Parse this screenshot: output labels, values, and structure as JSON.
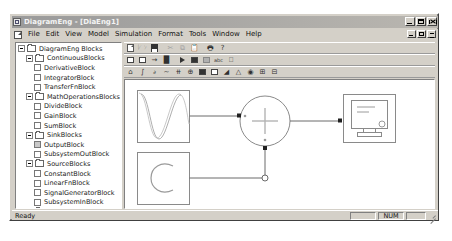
{
  "window": {
    "title": "DiagramEng - [DiaEng1]",
    "app_icon": "diagram-app-icon",
    "controls": [
      {
        "name": "minimize",
        "glyph": "_"
      },
      {
        "name": "maximize",
        "glyph": "□"
      },
      {
        "name": "close",
        "glyph": "✕"
      }
    ],
    "mdi_controls": [
      {
        "name": "mdi-minimize",
        "glyph": "_"
      },
      {
        "name": "mdi-restore",
        "glyph": "❐"
      },
      {
        "name": "mdi-close",
        "glyph": "✕"
      }
    ]
  },
  "menubar": {
    "doc_icon": "document-icon",
    "items": [
      {
        "label": "File"
      },
      {
        "label": "Edit"
      },
      {
        "label": "View"
      },
      {
        "label": "Model"
      },
      {
        "label": "Simulation"
      },
      {
        "label": "Format"
      },
      {
        "label": "Tools"
      },
      {
        "label": "Window"
      },
      {
        "label": "Help"
      }
    ]
  },
  "toolbars": [
    {
      "name": "standard-toolbar",
      "buttons": [
        {
          "name": "new-file",
          "icon": "doc"
        },
        {
          "name": "open-file",
          "icon": "folder-open"
        },
        {
          "name": "save-file",
          "icon": "floppy"
        },
        {
          "sep": true
        },
        {
          "name": "cut",
          "icon": "scissors",
          "disabled": true
        },
        {
          "name": "copy",
          "icon": "copy",
          "disabled": true
        },
        {
          "name": "paste",
          "icon": "clipboard",
          "disabled": true
        },
        {
          "sep": true
        },
        {
          "name": "print",
          "icon": "printer"
        },
        {
          "name": "about",
          "icon": "question"
        }
      ]
    },
    {
      "name": "model-toolbar",
      "buttons": [
        {
          "name": "new-block",
          "icon": "square"
        },
        {
          "name": "block-group",
          "icon": "square-wide"
        },
        {
          "name": "connection",
          "icon": "arrow-bend"
        },
        {
          "name": "paint",
          "icon": "paint"
        },
        {
          "sep": true
        },
        {
          "name": "run-simulation",
          "icon": "play"
        },
        {
          "name": "stop-simulation",
          "icon": "stop"
        },
        {
          "name": "simulation-params",
          "icon": "panel"
        },
        {
          "name": "label-abc",
          "icon": "abc"
        },
        {
          "name": "zoom-fit",
          "icon": "fit"
        }
      ]
    },
    {
      "name": "blocks-toolbar",
      "buttons": [
        {
          "name": "output-block-tool",
          "icon": "home"
        },
        {
          "name": "integrator-block-tool",
          "icon": "integral"
        },
        {
          "name": "derivative-block-tool",
          "icon": "derivative"
        },
        {
          "name": "transfer-fn-block-tool",
          "icon": "transfer"
        },
        {
          "name": "divide-block-tool",
          "icon": "divide"
        },
        {
          "name": "sum-block-tool",
          "icon": "sum-circle"
        },
        {
          "name": "display-block-tool",
          "icon": "monitor"
        },
        {
          "name": "constant-block-tool",
          "icon": "constant"
        },
        {
          "name": "signal-generator-tool",
          "icon": "ramp"
        },
        {
          "name": "gain-block-tool",
          "icon": "triangle-gain"
        },
        {
          "name": "subsystem-block-tool",
          "icon": "subsystem"
        },
        {
          "name": "subsystem-in-tool",
          "icon": "subsystem-in"
        },
        {
          "name": "subsystem-out-tool",
          "icon": "subsystem-out"
        }
      ]
    }
  ],
  "tree": {
    "name": "block-library-tree",
    "nodes": [
      {
        "label": "DiagramEng Blocks",
        "depth": 0,
        "type": "folder",
        "expanded": true
      },
      {
        "label": "ContinuousBlocks",
        "depth": 1,
        "type": "folder",
        "expanded": true
      },
      {
        "label": "DerivativeBlock",
        "depth": 2,
        "type": "leaf"
      },
      {
        "label": "IntegratorBlock",
        "depth": 2,
        "type": "leaf"
      },
      {
        "label": "TransferFnBlock",
        "depth": 2,
        "type": "leaf"
      },
      {
        "label": "MathOperationsBlocks",
        "depth": 1,
        "type": "folder",
        "expanded": true
      },
      {
        "label": "DivideBlock",
        "depth": 2,
        "type": "leaf"
      },
      {
        "label": "GainBlock",
        "depth": 2,
        "type": "leaf"
      },
      {
        "label": "SumBlock",
        "depth": 2,
        "type": "leaf"
      },
      {
        "label": "SinkBlocks",
        "depth": 1,
        "type": "folder",
        "expanded": true
      },
      {
        "label": "OutputBlock",
        "depth": 2,
        "type": "leaf",
        "selected": true
      },
      {
        "label": "SubsystemOutBlock",
        "depth": 2,
        "type": "leaf"
      },
      {
        "label": "SourceBlocks",
        "depth": 1,
        "type": "folder",
        "expanded": true
      },
      {
        "label": "ConstantBlock",
        "depth": 2,
        "type": "leaf"
      },
      {
        "label": "LinearFnBlock",
        "depth": 2,
        "type": "leaf"
      },
      {
        "label": "SignalGeneratorBlock",
        "depth": 2,
        "type": "leaf"
      },
      {
        "label": "SubsystemInBlock",
        "depth": 2,
        "type": "leaf"
      },
      {
        "label": "SubsystemBlocks",
        "depth": 1,
        "type": "folder",
        "expanded": true
      },
      {
        "label": "SubsystemBlock",
        "depth": 2,
        "type": "leaf"
      },
      {
        "label": "SubsystemInBlock",
        "depth": 2,
        "type": "leaf"
      },
      {
        "label": "SubsystemOutBlock",
        "depth": 2,
        "type": "leaf"
      }
    ]
  },
  "canvas": {
    "name": "diagram-canvas",
    "blocks": [
      {
        "name": "signal-generator-block",
        "type": "signal-generator",
        "x": 12,
        "y": 10,
        "w": 52,
        "h": 52,
        "glyph": "sine-wave"
      },
      {
        "name": "constant-block",
        "type": "constant",
        "x": 12,
        "y": 72,
        "w": 52,
        "h": 52,
        "glyph": "C"
      },
      {
        "name": "sum-block",
        "type": "sum",
        "cx": 140,
        "cy": 41,
        "r": 25,
        "glyph": "+"
      },
      {
        "name": "output-block",
        "type": "output",
        "x": 218,
        "y": 14,
        "w": 52,
        "h": 48,
        "glyph": "monitor"
      }
    ],
    "connections": [
      {
        "name": "conn-signal-to-sum",
        "from": "signal-generator-block",
        "to": "sum-block"
      },
      {
        "name": "conn-constant-to-sum",
        "from": "constant-block",
        "to": "sum-block"
      },
      {
        "name": "conn-sum-to-output",
        "from": "sum-block",
        "to": "output-block"
      }
    ]
  },
  "statusbar": {
    "message": "Ready",
    "panes": [
      {
        "name": "status-pane-blank",
        "label": ""
      },
      {
        "name": "status-pane-num",
        "label": "NUM"
      },
      {
        "name": "status-pane-caps",
        "label": ""
      }
    ]
  }
}
